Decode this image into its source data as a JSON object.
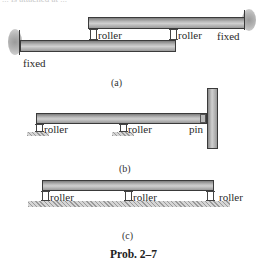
{
  "header": {
    "cut_text": "... is attached at ..."
  },
  "figure_a": {
    "caption": "(a)",
    "labels": {
      "roller_1": "roller",
      "roller_2": "roller",
      "fixed_right": "fixed",
      "fixed_left": "fixed"
    }
  },
  "figure_b": {
    "caption": "(b)",
    "labels": {
      "roller_1": "roller",
      "roller_2": "roller",
      "pin": "pin"
    }
  },
  "figure_c": {
    "caption": "(c)",
    "labels": {
      "roller_1": "roller",
      "roller_2": "roller",
      "roller_3": "roller"
    }
  },
  "title": "Prob. 2–7"
}
